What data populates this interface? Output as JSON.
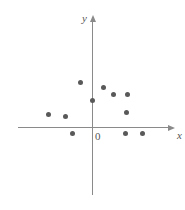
{
  "chart_data": {
    "type": "scatter",
    "title": "",
    "subtitle": "",
    "xlabel": "x",
    "ylabel": "y",
    "origin_label": "0",
    "grid": false,
    "legend": null,
    "axes": {
      "x_axis": {
        "orientation": "horizontal",
        "arrow": "right",
        "x1_px": 18,
        "x2_px": 168,
        "y_px": 127
      },
      "y_axis": {
        "orientation": "vertical",
        "arrow": "up",
        "y1_px": 22,
        "y2_px": 195,
        "x_px": 92
      },
      "origin_px": {
        "x": 92,
        "y": 127
      },
      "unit_px": 17,
      "xlim": [
        -4.5,
        4.5
      ],
      "ylim": [
        -1.5,
        6.0
      ]
    },
    "marker": {
      "shape": "circle",
      "color": "#595959",
      "size_px": 5
    },
    "axis_color": "#8a8a8a",
    "points_px": [
      {
        "x": 80,
        "y": 82
      },
      {
        "x": 103,
        "y": 87
      },
      {
        "x": 113,
        "y": 94
      },
      {
        "x": 127,
        "y": 94
      },
      {
        "x": 92,
        "y": 100
      },
      {
        "x": 126,
        "y": 112
      },
      {
        "x": 48,
        "y": 114
      },
      {
        "x": 65,
        "y": 116
      },
      {
        "x": 72,
        "y": 133
      },
      {
        "x": 125,
        "y": 133
      },
      {
        "x": 142,
        "y": 133
      }
    ],
    "points_data": [
      {
        "x": -0.7,
        "y": 2.6
      },
      {
        "x": 0.65,
        "y": 2.35
      },
      {
        "x": 1.2,
        "y": 1.95
      },
      {
        "x": 2.05,
        "y": 1.95
      },
      {
        "x": 0.0,
        "y": 1.6
      },
      {
        "x": 2.0,
        "y": 0.9
      },
      {
        "x": -2.6,
        "y": 0.75
      },
      {
        "x": -1.6,
        "y": 0.65
      },
      {
        "x": -1.2,
        "y": -0.35
      },
      {
        "x": 1.95,
        "y": -0.35
      },
      {
        "x": 2.95,
        "y": -0.35
      }
    ],
    "point_count": 11
  }
}
